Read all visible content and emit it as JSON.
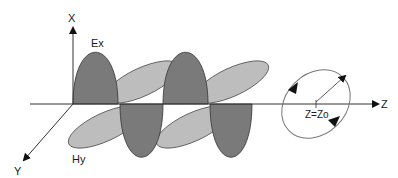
{
  "diagram": {
    "axes": {
      "x_label": "X",
      "y_label": "Y",
      "z_label": "Z"
    },
    "fields": {
      "e_label": "Ex",
      "h_label": "Hy"
    },
    "polarization": {
      "position_label": "Z=Zo"
    },
    "colors": {
      "e_field": "#7a7a7a",
      "h_field": "#bdbdbd",
      "outline": "#3a3a3a",
      "axis": "#333333",
      "ellipse": "#777777"
    }
  }
}
